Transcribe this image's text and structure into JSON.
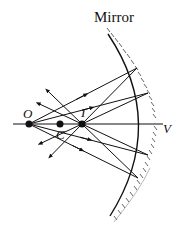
{
  "title": "Mirror",
  "labels": {
    "object": "O",
    "center": "C",
    "image": "I",
    "vertex": "V"
  },
  "colors": {
    "line": "#111111",
    "hatch": "#555555",
    "background": "#ffffff"
  }
}
